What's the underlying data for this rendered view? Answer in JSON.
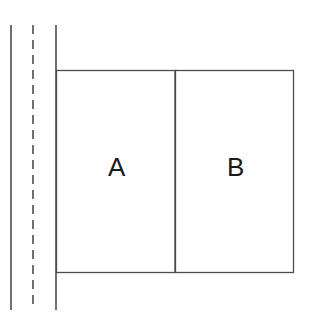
{
  "diagram": {
    "background_color": "#ffffff",
    "line_color": "#4d4d4d",
    "label_color": "#1a1a1a",
    "canvas": {
      "width": 318,
      "height": 332
    },
    "vertical_lines": [
      {
        "name": "outer-solid-line",
        "style": "solid",
        "x": 11,
        "y1": 25,
        "y2": 310
      },
      {
        "name": "center-dashed-line",
        "style": "dashed",
        "x": 33,
        "y1": 25,
        "y2": 310
      },
      {
        "name": "inner-solid-line",
        "style": "solid",
        "x": 56,
        "y1": 25,
        "y2": 310
      }
    ],
    "rooms": [
      {
        "name": "room-a",
        "label": "A",
        "x": 56,
        "y": 70,
        "width": 119,
        "height": 202,
        "label_x": 117,
        "label_y": 167
      },
      {
        "name": "room-b",
        "label": "B",
        "x": 175,
        "y": 70,
        "width": 118,
        "height": 202,
        "label_x": 236,
        "label_y": 167
      }
    ],
    "divider": {
      "name": "room-divider",
      "x": 175,
      "y1": 70,
      "y2": 272
    }
  }
}
